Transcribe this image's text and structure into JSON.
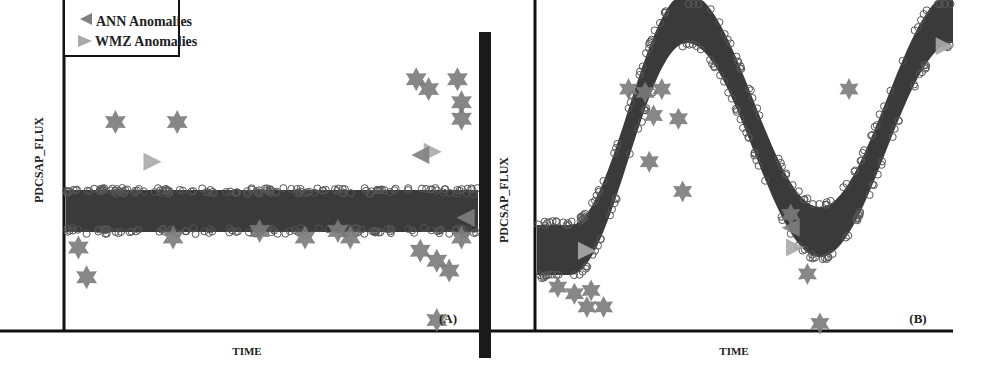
{
  "figure": {
    "divider_color": "#1a1a1a",
    "band_color": "#3a3a3a",
    "circle_edge_color": "#555555",
    "star_color": "#7a7a7a",
    "ann_triangle_color": "#808080",
    "wmz_triangle_color": "#aaaaaa"
  },
  "chart_data": [
    {
      "type": "scatter",
      "panel_label": "(A)",
      "xlabel": "TIME",
      "ylabel": "PDCSAP_FLUX",
      "legend": {
        "position": "upper-left",
        "entries": [
          {
            "marker": "left-triangle",
            "label": "ANN Anomalies",
            "color": "#808080"
          },
          {
            "marker": "right-triangle",
            "label": "WMZ Anomalies",
            "color": "#aaaaaa"
          }
        ]
      },
      "series": [
        {
          "name": "Flux data (circles)",
          "shape": "flat band",
          "x_range": [
            0,
            1
          ],
          "y_center": 0.55,
          "y_halfwidth": 0.08
        },
        {
          "name": "Star anomalies",
          "points": [
            [
              0.12,
              0.37
            ],
            [
              0.27,
              0.37
            ],
            [
              0.03,
              0.75
            ],
            [
              0.05,
              0.84
            ],
            [
              0.26,
              0.72
            ],
            [
              0.47,
              0.7
            ],
            [
              0.58,
              0.72
            ],
            [
              0.66,
              0.7
            ],
            [
              0.69,
              0.72
            ],
            [
              0.85,
              0.24
            ],
            [
              0.88,
              0.27
            ],
            [
              0.95,
              0.24
            ],
            [
              0.96,
              0.31
            ],
            [
              0.96,
              0.36
            ],
            [
              0.86,
              0.76
            ],
            [
              0.9,
              0.79
            ],
            [
              0.93,
              0.82
            ],
            [
              0.96,
              0.72
            ],
            [
              0.9,
              0.97
            ]
          ]
        },
        {
          "name": "WMZ Anomalies",
          "points": [
            [
              0.21,
              0.49
            ],
            [
              0.89,
              0.46
            ]
          ]
        },
        {
          "name": "ANN Anomalies",
          "points": [
            [
              0.86,
              0.47
            ],
            [
              0.97,
              0.66
            ]
          ]
        }
      ]
    },
    {
      "type": "scatter",
      "panel_label": "(B)",
      "xlabel": "TIME",
      "ylabel": "PDCSAP_FLUX",
      "series": [
        {
          "name": "Flux data (circles)",
          "shape": "sinusoid band",
          "description": "flat low start, rises to peak near x=0.35, falls to trough near x=0.65, rises again to right edge"
        },
        {
          "name": "Star anomalies",
          "points": [
            [
              0.05,
              0.87
            ],
            [
              0.09,
              0.89
            ],
            [
              0.13,
              0.88
            ],
            [
              0.12,
              0.93
            ],
            [
              0.16,
              0.93
            ],
            [
              0.22,
              0.27
            ],
            [
              0.26,
              0.28
            ],
            [
              0.3,
              0.27
            ],
            [
              0.28,
              0.35
            ],
            [
              0.34,
              0.36
            ],
            [
              0.27,
              0.49
            ],
            [
              0.35,
              0.58
            ],
            [
              0.61,
              0.65
            ],
            [
              0.65,
              0.83
            ],
            [
              0.68,
              0.98
            ],
            [
              0.75,
              0.27
            ]
          ]
        },
        {
          "name": "WMZ Anomalies",
          "points": [
            [
              0.12,
              0.76
            ],
            [
              0.62,
              0.75
            ],
            [
              0.98,
              0.14
            ]
          ]
        },
        {
          "name": "ANN Anomalies",
          "points": [
            [
              0.61,
              0.69
            ]
          ]
        }
      ]
    }
  ]
}
